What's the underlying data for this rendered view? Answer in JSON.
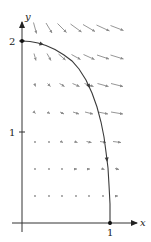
{
  "figure": {
    "width": 151,
    "height": 242,
    "colors": {
      "axis": "#333333",
      "curve": "#3a3a3a",
      "field": "#8a8a8a",
      "point": "#111111",
      "text": "#222222"
    },
    "origin_px": [
      22,
      223
    ],
    "unit_px": {
      "x": 88,
      "y": 91
    },
    "axes": {
      "x_label": "x",
      "y_label": "y",
      "x_ticks": [
        {
          "value": 1,
          "label": "1"
        }
      ],
      "y_ticks": [
        {
          "value": 1,
          "label": "1"
        },
        {
          "value": 2,
          "label": "2"
        }
      ]
    },
    "curve": {
      "description": "Solution trajectory from (0,2) to (1,0)",
      "start_point": [
        0,
        2
      ],
      "end_point": [
        1,
        0
      ],
      "points_px": [
        [
          22,
          41
        ],
        [
          30,
          41.5
        ],
        [
          38,
          43
        ],
        [
          46,
          45.5
        ],
        [
          55,
          49.5
        ],
        [
          64,
          55
        ],
        [
          72,
          61
        ],
        [
          79,
          69
        ],
        [
          86,
          80
        ],
        [
          92,
          93
        ],
        [
          97,
          107
        ],
        [
          101,
          122
        ],
        [
          104,
          137
        ],
        [
          106,
          152
        ],
        [
          108,
          168
        ],
        [
          109,
          185
        ],
        [
          110,
          204
        ],
        [
          110,
          223
        ]
      ],
      "arrows_at_index": [
        2,
        8,
        13
      ]
    },
    "vector_field": {
      "columns_px": [
        35,
        49,
        62,
        76,
        89,
        103,
        117
      ],
      "rows": [
        {
          "y_px": 28,
          "vectors": [
            [
              3,
              11
            ],
            [
              6,
              10
            ],
            [
              9,
              9
            ],
            [
              11,
              8
            ],
            [
              12,
              7
            ],
            [
              13,
              6
            ],
            [
              13,
              5
            ]
          ]
        },
        {
          "y_px": 57,
          "vectors": [
            [
              2,
              7
            ],
            [
              4,
              7
            ],
            [
              7,
              6
            ],
            [
              9,
              5
            ],
            [
              11,
              5
            ],
            [
              12,
              4
            ],
            [
              13,
              4
            ]
          ]
        },
        {
          "y_px": 85,
          "vectors": [
            [
              1,
              3
            ],
            [
              3,
              3
            ],
            [
              5,
              3
            ],
            [
              7,
              3
            ],
            [
              9,
              3
            ],
            [
              11,
              3
            ],
            [
              12,
              3
            ]
          ]
        },
        {
          "y_px": 113,
          "vectors": [
            [
              1,
              1
            ],
            [
              2,
              1
            ],
            [
              4,
              2
            ],
            [
              6,
              2
            ],
            [
              8,
              2
            ],
            [
              10,
              2
            ],
            [
              12,
              2
            ]
          ]
        },
        {
          "y_px": 142,
          "vectors": [
            [
              1,
              0
            ],
            [
              1,
              0
            ],
            [
              2,
              1
            ],
            [
              3,
              1
            ],
            [
              5,
              1
            ],
            [
              6,
              1
            ],
            [
              8,
              1
            ]
          ]
        },
        {
          "y_px": 169,
          "vectors": [
            [
              1,
              0
            ],
            [
              1,
              0
            ],
            [
              1,
              0
            ],
            [
              2,
              0
            ],
            [
              2,
              0
            ],
            [
              3,
              1
            ],
            [
              4,
              1
            ]
          ]
        },
        {
          "y_px": 196,
          "vectors": [
            [
              1,
              0
            ],
            [
              1,
              0
            ],
            [
              1,
              0
            ],
            [
              1,
              0
            ],
            [
              1,
              0
            ],
            [
              1,
              0
            ],
            [
              2,
              0
            ]
          ]
        }
      ]
    }
  }
}
